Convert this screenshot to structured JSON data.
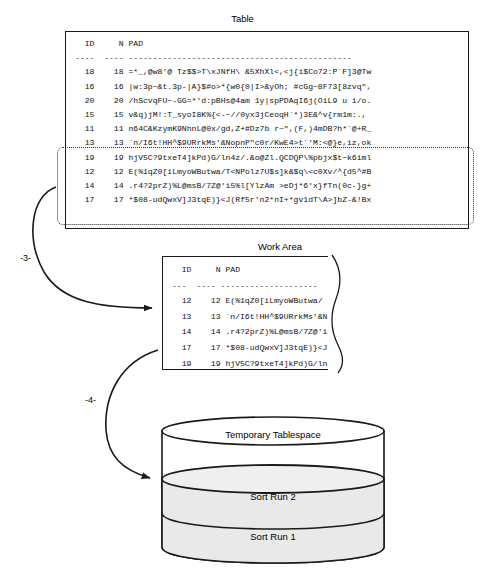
{
  "diagram": {
    "colors": {
      "stroke": "#1a1a1a",
      "fill_shaded": "#e8e8e8",
      "background": "#ffffff"
    }
  },
  "table_section": {
    "caption": "Table",
    "columns_header": "  ID     N PAD",
    "rule": "----  ---- ----------------------------------------------",
    "rows": [
      "  18    18 =*_,@w8'@ Tz$$>T\\xJNfH\\ &5XhXl<,<j{i$Co72:P`F]3@Tw",
      "  16    16 |w:3p~&t.3p-|A}$#o>*{w0{0|I>&yOh; #cGg~8F73[8zvq\",",
      "  20    20 /hScvqFU~-GG=*'d:pBHs@4am 1y|spPDAqI6j(OiL9 u i/o.",
      "  15    15 v&q)jM!:T_syoI8K%{<-~//0yx3jCeoqH`*)3E&^v{rm1m:.,",
      "  11    11 n64C&KzymK9NhnL@0x/gd,Z+#Dz7b r~\",(F,)4mDB?h*`@+R_",
      "  13    13 `n/I6t!HH^$9URrkMs'&NopnP\"c0r/KwE4>t`'M:<@}e,iz,ok",
      "  19    19 hjV5C?9txeT4]kPd)G/ln4z/.&o@Zl.QCDQP\\%pbjx$t~k6iml",
      "  12    12 E(%1qZ0[iLmyoWButwa/T<NPolz7U$s]k&$q\\<c0Xv/^{d5^#B",
      "  14    14 .r4?2prZ)%L@msB/7Z@'i5%l[YlzAm >eDj*6'x}fTn(0c-}g+",
      "  17    17 *$08-udQwxV]J3tqE)}<J(Rf5r'n2*nI+*gv1dT\\A>]bZ-&!Bx"
    ],
    "selected_row_indices": [
      5,
      6,
      7,
      8,
      9
    ]
  },
  "work_area_section": {
    "caption": "Work Area",
    "columns_header": "  ID     N PAD",
    "rule": "---  ---- --------------------",
    "rows": [
      "  12    12 E(%1qZ0[iLmyoWButwa/",
      "  13    13 `n/I6t!HH^$9URrkMs'&N",
      "  14    14 .r4?2prZ)%L@msB/7Z@'i5%",
      "  17    17 *$08-udQwxV]J3tqE)}<J(",
      "  19    19 hjV5C?9txeT4]kPd)G/ln4z"
    ]
  },
  "steps": {
    "step_3": "-3-",
    "step_4": "-4-"
  },
  "tablespace": {
    "title": "Temporary Tablespace",
    "segments": [
      {
        "label": "Sort Run 2"
      },
      {
        "label": "Sort Run 1"
      }
    ]
  }
}
